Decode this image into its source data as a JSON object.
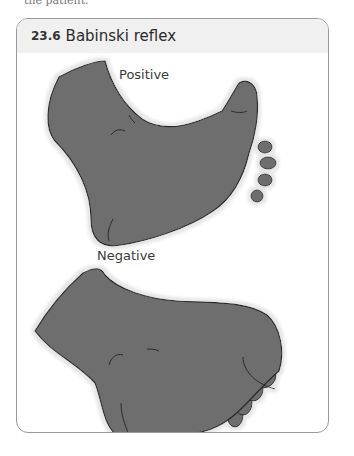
{
  "page": {
    "cutoff_text": "the patient."
  },
  "figure": {
    "number": "23.6",
    "title": "Babinski reflex",
    "panels": [
      {
        "label": "Positive",
        "description": "foot with big toe extended upward and other toes fanned out"
      },
      {
        "label": "Negative",
        "description": "foot with toes curled downward"
      }
    ],
    "colors": {
      "foot_fill": "#6e6e6e",
      "foot_outline": "#2a2a2a",
      "foot_glow": "#e6e6e6",
      "header_bg": "#f0f0f0",
      "border": "#9a9a9a"
    }
  }
}
